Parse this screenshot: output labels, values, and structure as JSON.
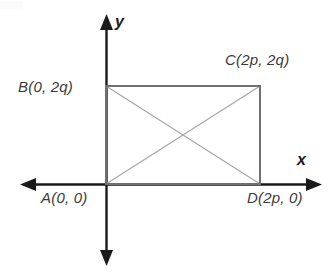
{
  "figure": {
    "kind": "coordinate-plane-rectangle-with-diagonals",
    "background_color": "#ffffff",
    "axis_color": "#1a1a1a",
    "rectangle_color": "#707070",
    "diagonal_color": "#a8a8a8",
    "label_color": "#3b3b3b"
  },
  "axes": {
    "x_label": "x",
    "y_label": "y",
    "origin_px": {
      "x": 106,
      "y": 184
    },
    "x_axis_px": {
      "x1": 20,
      "y1": 184,
      "x2": 322,
      "y2": 184
    },
    "y_axis_px": {
      "x1": 106,
      "y1": 14,
      "x2": 106,
      "y2": 266
    },
    "arrowheads": [
      "left",
      "right",
      "up",
      "down"
    ]
  },
  "vertices": [
    {
      "id": "A",
      "label": "A(0, 0)",
      "coords": "(0, 0)",
      "px": {
        "x": 106,
        "y": 184
      }
    },
    {
      "id": "B",
      "label": "B(0, 2q)",
      "coords": "(0, 2q)",
      "px": {
        "x": 106,
        "y": 86
      }
    },
    {
      "id": "C",
      "label": "C(2p, 2q)",
      "coords": "(2p, 2q)",
      "px": {
        "x": 260,
        "y": 86
      }
    },
    {
      "id": "D",
      "label": "D(2p, 0)",
      "coords": "(2p, 0)",
      "px": {
        "x": 260,
        "y": 184
      }
    }
  ],
  "shape": {
    "name": "rectangle ABCD",
    "edges": [
      "A-B",
      "B-C",
      "C-D",
      "D-A"
    ],
    "diagonals": [
      "A-C",
      "B-D"
    ]
  }
}
